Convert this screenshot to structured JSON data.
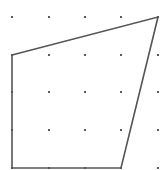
{
  "diagram": {
    "type": "dot-grid-polygon",
    "grid": {
      "columns_x": [
        12,
        49,
        85,
        121,
        158
      ],
      "rows_y": [
        17,
        55,
        92,
        130,
        168
      ],
      "dot_color": "#333333",
      "dot_radius": 1.1
    },
    "polygon": {
      "shape": "quadrilateral",
      "stroke_color": "#555555",
      "stroke_width": 1.6,
      "vertices_grid": [
        [
          0,
          1
        ],
        [
          4,
          0
        ],
        [
          3,
          4
        ],
        [
          0,
          4
        ]
      ],
      "vertices_px": [
        [
          12,
          55
        ],
        [
          158,
          17
        ],
        [
          121,
          168
        ],
        [
          12,
          168
        ]
      ]
    }
  }
}
